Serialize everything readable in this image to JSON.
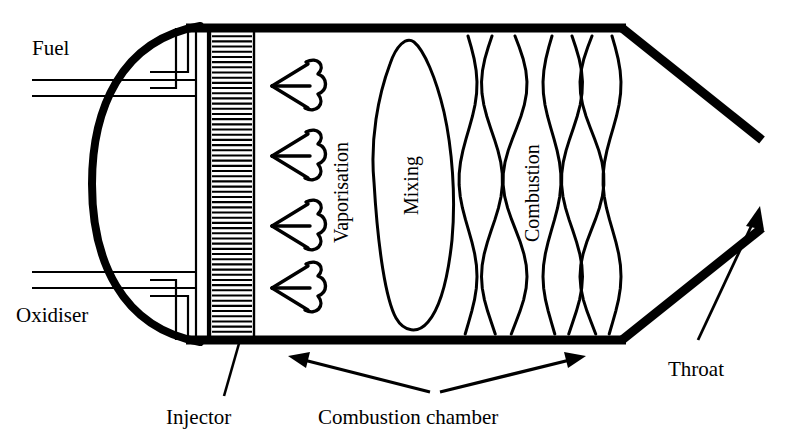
{
  "figure": {
    "background_color": "#ffffff",
    "ink_color": "#000000",
    "width": 794,
    "height": 446
  },
  "labels": {
    "fuel": "Fuel",
    "oxidiser": "Oxidiser",
    "injector": "Injector",
    "vaporisation": "Vaporisation",
    "mixing": "Mixing",
    "combustion": "Combustion",
    "combustion_chamber": "Combustion chamber",
    "throat": "Throat"
  },
  "components": {
    "dome": {
      "name": "injector-dome",
      "description": "thick semicircular end closure on the left"
    },
    "manifold": {
      "name": "propellant-manifold",
      "description": "vertical distribution channel feeding the injector face"
    },
    "injector_plate": {
      "name": "injector-plate",
      "description": "hatched vertical plate",
      "hatch_line_count": 60
    },
    "chamber": {
      "name": "combustion-chamber-body",
      "description": "straight walled cylindrical section"
    },
    "nozzle": {
      "name": "converging-nozzle",
      "description": "converging walls leading to the throat"
    },
    "spray_cones": {
      "name": "vaporisation-spray-cones",
      "count": 4
    },
    "mixing_blob": {
      "name": "mixing-zone-blob",
      "count": 1
    },
    "flame_waves": {
      "name": "combustion-flame-waves",
      "count": 7
    }
  },
  "inlets": [
    {
      "id": "fuel",
      "label": "Fuel",
      "side": "top-left"
    },
    {
      "id": "oxidiser",
      "label": "Oxidiser",
      "side": "bottom-left"
    }
  ],
  "annotations": [
    {
      "id": "injector",
      "label": "Injector",
      "arrow": "single-leader-up"
    },
    {
      "id": "combustion-chamber",
      "label": "Combustion chamber",
      "arrow": "double-headed-v"
    },
    {
      "id": "throat",
      "label": "Throat",
      "arrow": "single-up-right"
    }
  ]
}
